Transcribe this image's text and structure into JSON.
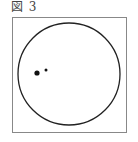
{
  "figure": {
    "caption": "図 3",
    "frame": {
      "x": 12,
      "y": 17,
      "width": 114,
      "height": 115,
      "stroke": "#888888"
    },
    "circle": {
      "cx": 69,
      "cy": 74,
      "r": 51,
      "stroke": "#222222"
    },
    "dots": [
      {
        "cx": 37,
        "cy": 73,
        "r": 2.6,
        "fill": "#111111"
      },
      {
        "cx": 46,
        "cy": 70,
        "r": 1.5,
        "fill": "#111111"
      }
    ]
  }
}
